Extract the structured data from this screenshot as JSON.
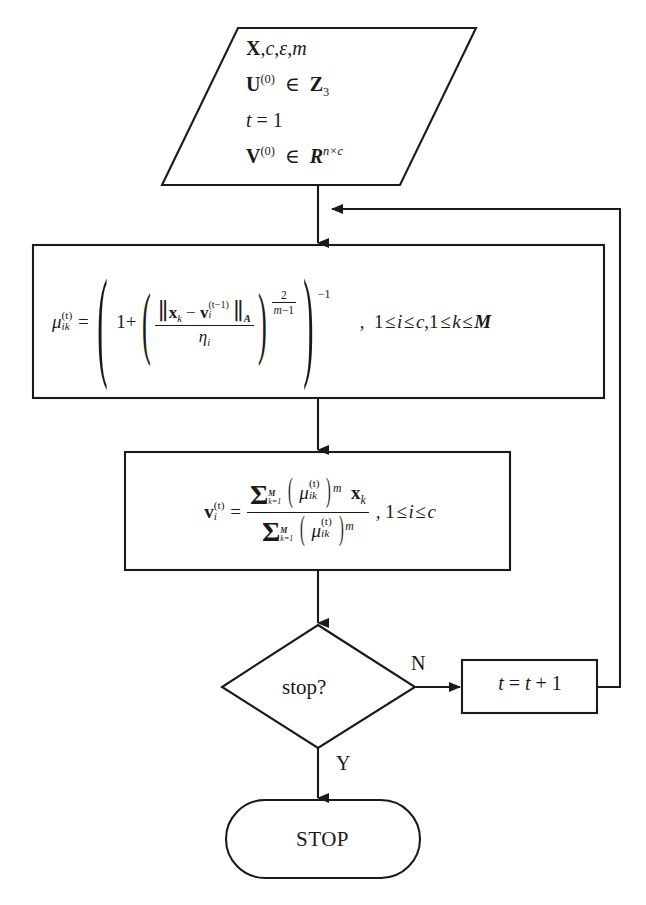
{
  "diagram": {
    "line_color": "#1a1a1a",
    "fill_color": "#ffffff"
  },
  "nodes": {
    "input": {
      "shape": "parallelogram",
      "name": "input-parameters",
      "lines": [
        {
          "id": "line1",
          "text": "X, c, ε, m"
        },
        {
          "id": "line2",
          "text": "U(0) ∈ Z3"
        },
        {
          "id": "line3",
          "text": "t = 1"
        },
        {
          "id": "line4",
          "text": "V(0) ∈ R n×c"
        }
      ]
    },
    "membership_box": {
      "shape": "process",
      "name": "membership-update-equation",
      "equation_text": "μ_ik^(t) = ( 1 + ( ||x_k − v_i^(t−1)||_A / η_i )^(2/(m−1)) )^(−1)",
      "condition_text": "1 ≤ i ≤ c, 1 ≤ k ≤ M",
      "parts": {
        "mu": "μ",
        "mu_sub": "ik",
        "mu_sup": "(t)",
        "equals": "=",
        "one_plus": "1+",
        "norm_open": "‖",
        "x": "x",
        "x_sub": "k",
        "minus": "−",
        "v": "v",
        "v_sub": "i",
        "v_sup": "(t−1)",
        "norm_close": "‖",
        "norm_sub": "A",
        "eta": "η",
        "eta_sub": "i",
        "exp_num": "2",
        "exp_den": "m−1",
        "outer_exp": "−1",
        "comma": ",",
        "cond_i": "1 ≤ i ≤ c,",
        "cond_k": "1 ≤ k ≤ M"
      }
    },
    "centroid_box": {
      "shape": "process",
      "name": "centroid-update-equation",
      "equation_text": "v_i^(t) = Σ_{k=1}^{M} (μ_ik^(t))^m x_k / Σ_{k=1}^{M} (μ_ik^(t))^m , 1 ≤ i ≤ c",
      "parts": {
        "v": "v",
        "v_sub": "i",
        "v_sup": "(t)",
        "equals": "=",
        "sigma": "Σ",
        "sum_upper": "M",
        "sum_lower": "k=1",
        "mu": "μ",
        "mu_sub": "ik",
        "mu_sup": "(t)",
        "power_m": "m",
        "x": "x",
        "x_sub": "k",
        "comma": ",",
        "condition": "1 ≤ i ≤ c"
      }
    },
    "decision": {
      "shape": "diamond",
      "name": "stop-decision",
      "label": "stop?"
    },
    "increment": {
      "shape": "process",
      "name": "iteration-increment",
      "label": "t = t + 1",
      "parts": {
        "t": "t",
        "eq": "=",
        "t2": "t",
        "plus": "+",
        "one": "1"
      }
    },
    "terminator": {
      "shape": "rounded-terminator",
      "name": "stop-terminator",
      "label": "STOP"
    }
  },
  "edges": {
    "branch_no": "N",
    "branch_yes": "Y",
    "loop_description": "feedback from t = t + 1 back to membership-update input"
  }
}
